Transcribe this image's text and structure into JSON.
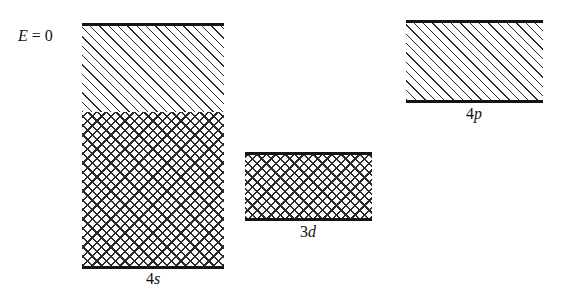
{
  "figure": {
    "type": "energy-band-diagram",
    "background_color": "#ffffff",
    "line_color": "#141414",
    "hatch_color": "#2b2b2b"
  },
  "axis": {
    "zero_level_label": "E = 0",
    "zero_level_symbol": "E",
    "zero_level_value": "0"
  },
  "bands": [
    {
      "id": "4s",
      "label_number": "4",
      "label_orbital": "s",
      "label": "4s",
      "x": 82,
      "width": 142,
      "top": 26,
      "bottom": 266,
      "filled_from": 112,
      "occupied_fill": "cross-hatch",
      "empty_fill": "diagonal-hatch",
      "label_x": 153,
      "label_y": 270
    },
    {
      "id": "3d",
      "label_number": "3",
      "label_orbital": "d",
      "label": "3d",
      "x": 245,
      "width": 127,
      "top": 155,
      "bottom": 218,
      "filled_from": 155,
      "occupied_fill": "cross-hatch",
      "empty_fill": "none",
      "label_x": 308,
      "label_y": 223
    },
    {
      "id": "4p",
      "label_number": "4",
      "label_orbital": "p",
      "label": "4p",
      "x": 406,
      "width": 137,
      "top": 23,
      "bottom": 100,
      "filled_from": 100,
      "occupied_fill": "none",
      "empty_fill": "diagonal-hatch",
      "label_x": 474,
      "label_y": 105
    }
  ]
}
